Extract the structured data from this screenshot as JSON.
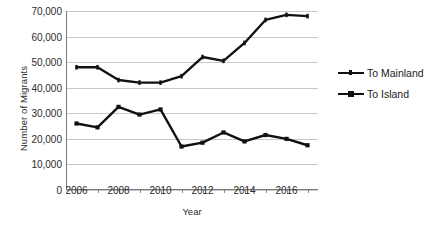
{
  "chart_data": {
    "type": "line",
    "title": "",
    "xlabel": "Year",
    "ylabel": "Number of Migrants",
    "x": [
      2006,
      2007,
      2008,
      2009,
      2010,
      2011,
      2012,
      2013,
      2014,
      2015,
      2016,
      2017
    ],
    "xtick_labels": [
      "2006",
      "2008",
      "2010",
      "2012",
      "2014",
      "2016"
    ],
    "xtick_values": [
      2006,
      2008,
      2010,
      2012,
      2014,
      2016
    ],
    "ytick_labels": [
      "0",
      "10,000",
      "20,000",
      "30,000",
      "40,000",
      "50,000",
      "60,000",
      "70,000"
    ],
    "ytick_values": [
      0,
      10000,
      20000,
      30000,
      40000,
      50000,
      60000,
      70000
    ],
    "ylim": [
      0,
      70000
    ],
    "xlim": [
      2005.5,
      2017.5
    ],
    "grid": true,
    "legend_position": "right",
    "series": [
      {
        "name": "To Mainland",
        "color": "#111111",
        "values": [
          48000,
          48000,
          43000,
          42000,
          42000,
          44500,
          52000,
          50500,
          57500,
          66500,
          68500,
          68000
        ]
      },
      {
        "name": "To Island",
        "color": "#111111",
        "values": [
          26000,
          24500,
          32500,
          29500,
          31500,
          17000,
          18500,
          22500,
          19000,
          21500,
          20000,
          17500
        ]
      }
    ]
  },
  "legend": {
    "items": [
      {
        "label": "To Mainland"
      },
      {
        "label": "To Island"
      }
    ]
  }
}
